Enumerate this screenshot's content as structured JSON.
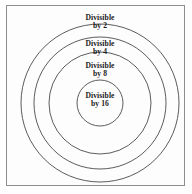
{
  "figure": {
    "type": "nested-set-diagram",
    "background_color": "#fefefe",
    "frame": {
      "border_color": "#8d8d8d",
      "fill_color": "#fdfdfd"
    },
    "circle_stroke_color": "#4a4a4a",
    "text_color": "#1a1a1a",
    "center": {
      "x": 100,
      "y": 103
    },
    "rings": [
      {
        "id": "divisible-by-2",
        "radius": 79,
        "label_line1": "Divisible",
        "label_line2": "by 2",
        "divisor": 2
      },
      {
        "id": "divisible-by-4",
        "radius": 66,
        "label_line1": "Divisible",
        "label_line2": "by 4",
        "divisor": 4
      },
      {
        "id": "divisible-by-8",
        "radius": 51,
        "label_line1": "Divisible",
        "label_line2": "by 8",
        "divisor": 8
      },
      {
        "id": "divisible-by-16",
        "radius": 23,
        "label_line1": "Divisible",
        "label_line2": "by 16",
        "divisor": 16
      }
    ]
  }
}
